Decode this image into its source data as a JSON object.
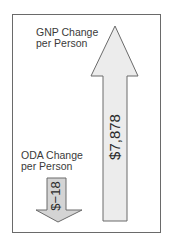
{
  "diagram": {
    "gnp": {
      "label_line1": "GNP Change",
      "label_line2": "per Person",
      "value": "$7,878",
      "direction": "up",
      "fill": "#ececec",
      "stroke": "#6a6a6a"
    },
    "oda": {
      "label_line1": "ODA Change",
      "label_line2": "per Person",
      "value": "$−18",
      "direction": "down",
      "fill": "#d4d4d4",
      "stroke": "#6a6a6a"
    }
  }
}
